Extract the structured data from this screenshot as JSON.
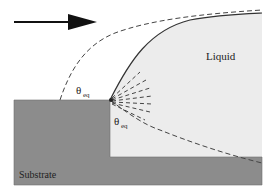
{
  "diagram": {
    "labels": {
      "liquid": "Liquid",
      "substrate": "Substrate",
      "theta_top": "θ",
      "theta_top_sub": "eq",
      "theta_corner": "θ",
      "theta_corner_sub": "eq"
    },
    "icons": {
      "flow_arrow": "right-arrow-icon"
    },
    "colors": {
      "substrate": "#8c8c8c",
      "liquid": "#ececec",
      "line": "#333333",
      "background": "#ffffff"
    }
  }
}
